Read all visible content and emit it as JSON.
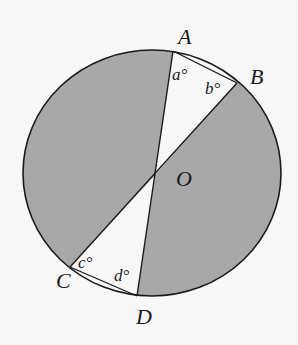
{
  "diagram": {
    "type": "circle-geometry",
    "colors": {
      "background": "#f7f7f7",
      "shaded": "#a8a8a8",
      "unshaded": "#f7f7f7",
      "stroke": "#1a1a1a"
    },
    "circle": {
      "center": [
        152,
        173
      ],
      "rx": 129,
      "ry": 123
    },
    "center_label": "O",
    "points": {
      "A": {
        "label": "A",
        "x": 173,
        "y": 51
      },
      "B": {
        "label": "B",
        "x": 237,
        "y": 83
      },
      "C": {
        "label": "C",
        "x": 70,
        "y": 267
      },
      "D": {
        "label": "D",
        "x": 137,
        "y": 296
      }
    },
    "chords": [
      "AD",
      "BC",
      "AB",
      "CD"
    ],
    "angles": {
      "a": "a°",
      "b": "b°",
      "c": "c°",
      "d": "d°"
    }
  }
}
